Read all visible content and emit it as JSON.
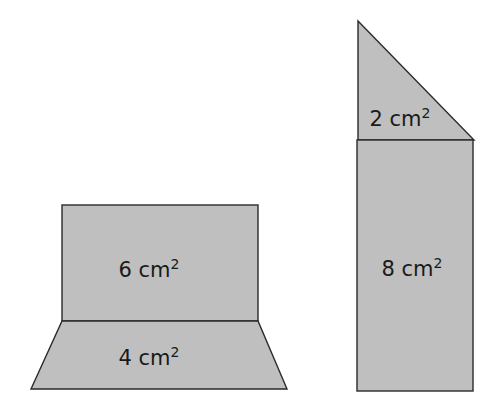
{
  "figure": {
    "left_composite": {
      "rectangle": {
        "area_value": "6",
        "unit": "cm",
        "exponent": "2"
      },
      "trapezoid": {
        "area_value": "4",
        "unit": "cm",
        "exponent": "2"
      }
    },
    "right_composite": {
      "triangle": {
        "area_value": "2",
        "unit": "cm",
        "exponent": "2"
      },
      "rectangle": {
        "area_value": "8",
        "unit": "cm",
        "exponent": "2"
      }
    }
  },
  "colors": {
    "fill": "#bfbfbf",
    "stroke": "#2a2a2a",
    "text": "#1a1a1a"
  }
}
